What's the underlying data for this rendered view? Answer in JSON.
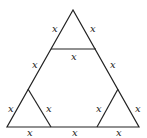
{
  "diagram": {
    "stroke_color": "#222222",
    "labels": [
      {
        "text": "x",
        "x": 52,
        "y": 24
      },
      {
        "text": "x",
        "x": 90,
        "y": 24
      },
      {
        "text": "x",
        "x": 71,
        "y": 52
      },
      {
        "text": "x",
        "x": 32,
        "y": 60
      },
      {
        "text": "x",
        "x": 110,
        "y": 60
      },
      {
        "text": "x",
        "x": 8,
        "y": 104
      },
      {
        "text": "x",
        "x": 46,
        "y": 104
      },
      {
        "text": "x",
        "x": 96,
        "y": 104
      },
      {
        "text": "x",
        "x": 135,
        "y": 104
      },
      {
        "text": "x",
        "x": 27,
        "y": 128
      },
      {
        "text": "x",
        "x": 72,
        "y": 128
      },
      {
        "text": "x",
        "x": 116,
        "y": 128
      }
    ]
  }
}
